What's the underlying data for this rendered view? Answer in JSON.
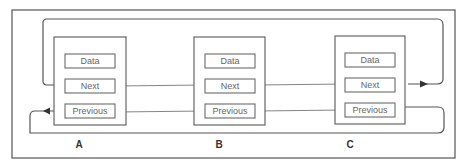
{
  "diagram": {
    "type": "doubly-circular-linked-list",
    "nodes": [
      {
        "id": "A",
        "label": "A",
        "fields": [
          "Data",
          "Next",
          "Previous"
        ]
      },
      {
        "id": "B",
        "label": "B",
        "fields": [
          "Data",
          "Next",
          "Previous"
        ]
      },
      {
        "id": "C",
        "label": "C",
        "fields": [
          "Data",
          "Next",
          "Previous"
        ]
      }
    ],
    "edges": [
      {
        "from": "A.Next",
        "to": "B.Next",
        "kind": "next"
      },
      {
        "from": "B.Next",
        "to": "C.Next",
        "kind": "next"
      },
      {
        "from": "C.Next",
        "to": "A.Next",
        "kind": "next-wraparound"
      },
      {
        "from": "C.Previous",
        "to": "B.Previous",
        "kind": "previous"
      },
      {
        "from": "B.Previous",
        "to": "A.Previous",
        "kind": "previous"
      },
      {
        "from": "A.Previous",
        "to": "C.Previous",
        "kind": "previous-wraparound"
      }
    ],
    "colors": {
      "stroke": "#555555",
      "text": "#666666",
      "label": "#333333",
      "background": "#ffffff"
    }
  }
}
